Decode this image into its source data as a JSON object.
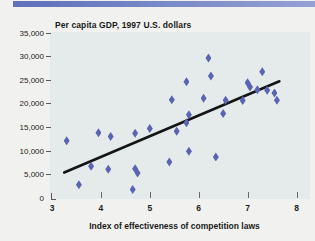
{
  "banner": {
    "color_left": "#6070ba",
    "color_right": "#93a1d5"
  },
  "chart_data": {
    "type": "scatter",
    "title": "Per capita GDP, 1997 U.S. dollars",
    "xlabel": "Index of effectiveness of competition laws",
    "ylabel": "",
    "xlim": [
      3,
      8
    ],
    "ylim": [
      0,
      35000
    ],
    "x_ticks": [
      3,
      4,
      5,
      6,
      7,
      8
    ],
    "y_ticks": [
      0,
      5000,
      10000,
      15000,
      20000,
      25000,
      30000,
      35000
    ],
    "y_tick_labels": [
      "0",
      "5,000",
      "10,000",
      "15,000",
      "20,000",
      "25,000",
      "30,000",
      "35,000"
    ],
    "grid": false,
    "legend": "none",
    "marker": "diamond",
    "marker_color": "#5964b2",
    "points": [
      [
        3.3,
        12200
      ],
      [
        3.55,
        2900
      ],
      [
        3.8,
        6800
      ],
      [
        3.95,
        13900
      ],
      [
        4.15,
        6200
      ],
      [
        4.2,
        13100
      ],
      [
        4.65,
        1900
      ],
      [
        4.7,
        6300
      ],
      [
        4.75,
        5400
      ],
      [
        4.7,
        13800
      ],
      [
        5.0,
        14800
      ],
      [
        5.4,
        7700
      ],
      [
        5.45,
        20900
      ],
      [
        5.55,
        14200
      ],
      [
        5.75,
        24700
      ],
      [
        5.8,
        17700
      ],
      [
        5.75,
        16000
      ],
      [
        5.8,
        10000
      ],
      [
        6.1,
        21200
      ],
      [
        6.2,
        29700
      ],
      [
        6.25,
        25900
      ],
      [
        6.35,
        8800
      ],
      [
        6.5,
        18000
      ],
      [
        6.55,
        20800
      ],
      [
        6.9,
        20700
      ],
      [
        7.0,
        24500
      ],
      [
        7.05,
        23600
      ],
      [
        7.2,
        23000
      ],
      [
        7.3,
        26800
      ],
      [
        7.4,
        22900
      ],
      [
        7.55,
        22300
      ],
      [
        7.6,
        20800
      ]
    ],
    "trend_line": {
      "x1": 3.25,
      "y1": 5500,
      "x2": 7.65,
      "y2": 24800,
      "color": "#151515"
    }
  }
}
